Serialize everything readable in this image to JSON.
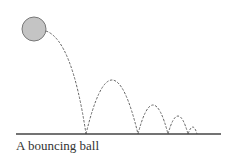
{
  "caption": "A bouncing ball",
  "colors": {
    "ball_fill": "#c4c4c4",
    "ball_stroke": "#777777",
    "path_stroke": "#666666",
    "ground": "#444444"
  },
  "ball": {
    "cx": 34,
    "cy": 29,
    "r": 12
  },
  "ground": {
    "x1": 16,
    "x2": 221,
    "y": 134
  },
  "trajectory": [
    "M46,31 Q72,40 86,134",
    "M86,134 Q112,26 138,134",
    "M138,134 Q153,76 168,134",
    "M168,134 Q178,98 188,134",
    "M188,134 Q193,120 197,134"
  ]
}
